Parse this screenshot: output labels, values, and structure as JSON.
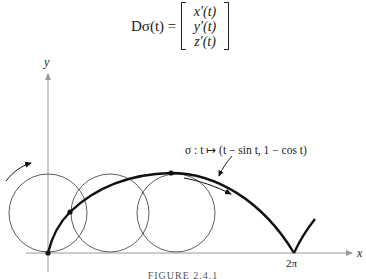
{
  "equation": {
    "lhs": "Dσ(t) =",
    "matrix_entries": [
      "x′(t)",
      "y′(t)",
      "z′(t)"
    ]
  },
  "figure": {
    "axes": {
      "x_label": "x",
      "y_label": "y",
      "x_tick_label": "2π"
    },
    "curve_annotation": "σ : t ↦ (t − sin t, 1 − cos t)",
    "circles": [
      {
        "name": "rolling-circle-1",
        "cx": 48,
        "cy": 213,
        "r": 39
      },
      {
        "name": "rolling-circle-2",
        "cx": 110,
        "cy": 213,
        "r": 39
      },
      {
        "name": "rolling-circle-3",
        "cx": 176,
        "cy": 213,
        "r": 39
      }
    ],
    "marked_points": [
      {
        "x": 48,
        "y": 253
      },
      {
        "x": 70,
        "y": 212
      },
      {
        "x": 171,
        "y": 173
      }
    ],
    "colors": {
      "curve": "#111111",
      "axes": "#9a9a9a",
      "circles": "#333333"
    },
    "caption": "FIGURE 2.4.1"
  }
}
